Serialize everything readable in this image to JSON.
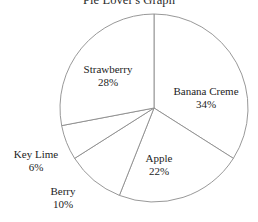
{
  "title": "Pie Lover's Graph",
  "chart_data": {
    "type": "pie",
    "title": "Pie Lover's Graph",
    "xlabel": "",
    "ylabel": "",
    "legend": "none",
    "grid": false,
    "units": "percent",
    "start_angle_deg": 0,
    "direction": "clockwise",
    "total": 100,
    "categories": [
      "Banana Creme",
      "Apple",
      "Berry",
      "Key Lime",
      "Strawberry"
    ],
    "values": [
      34,
      22,
      10,
      6,
      28
    ],
    "slices": [
      {
        "label": "Banana Creme",
        "value": 34,
        "value_text": "34%"
      },
      {
        "label": "Apple",
        "value": 22,
        "value_text": "22%"
      },
      {
        "label": "Berry",
        "value": 10,
        "value_text": "10%"
      },
      {
        "label": "Key Lime",
        "value": 6,
        "value_text": "6%"
      },
      {
        "label": "Strawberry",
        "value": 28,
        "value_text": "28%"
      }
    ],
    "colors": {
      "slice_fill": "#ffffff",
      "slice_stroke": "#8c8c8c",
      "text": "#232323",
      "background": "#ffffff"
    }
  }
}
